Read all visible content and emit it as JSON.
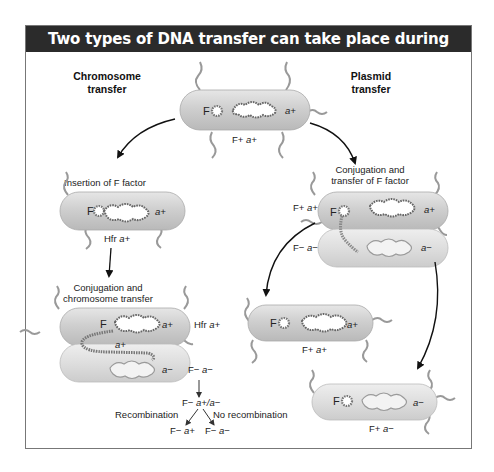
{
  "title": "Two types of DNA transfer can take place during conjugation",
  "columns": {
    "left": {
      "line1": "Chromosome",
      "line2": "transfer"
    },
    "right": {
      "line1": "Plasmid",
      "line2": "transfer"
    }
  },
  "colors": {
    "title_bg": "#2b2b2b",
    "cell_fill": "#d0d0d0",
    "cell_light": "#e4e4e4",
    "dna_dark": "#555555",
    "dna_light": "#ffffff"
  },
  "cells": {
    "top": {
      "f_label": "F",
      "gene_label": "a+",
      "genotype_F": "F+",
      "genotype_a": "a+"
    },
    "hfr": {
      "step": "Insertion of F factor",
      "f_label": "F",
      "gene_label": "a+",
      "genotype_F": "Hfr",
      "genotype_a": "a+"
    },
    "chrom_conj": {
      "step_line1": "Conjugation and",
      "step_line2": "chromosome transfer",
      "donor_f": "F",
      "donor_gene": "a+",
      "donor_genotype_F": "Hfr",
      "donor_genotype_a": "a+",
      "transfer_gene": "a+",
      "recipient_gene": "a−",
      "recipient_genotype_F": "F−",
      "recipient_genotype_a": "a−"
    },
    "recomb": {
      "start_F": "F−",
      "start_a": "a−",
      "merodiploid_F": "F−",
      "merodiploid_a": "a+/a−",
      "recombination": "Recombination",
      "no_recombination": "No recombination",
      "result1_F": "F−",
      "result1_a": "a+",
      "result2_F": "F−",
      "result2_a": "a−"
    },
    "plasmid_conj": {
      "step_line1": "Conjugation and",
      "step_line2": "transfer of F factor",
      "donor_genotype_F": "F+",
      "donor_genotype_a": "a+",
      "donor_f": "F",
      "donor_gene": "a+",
      "recipient_genotype_F": "F−",
      "recipient_genotype_a": "a−",
      "recipient_gene": "a−"
    },
    "result_donor": {
      "f_label": "F",
      "gene_label": "a+",
      "genotype_F": "F+",
      "genotype_a": "a+"
    },
    "result_recipient": {
      "f_label": "F",
      "gene_label": "a−",
      "genotype_F": "F+",
      "genotype_a": "a−"
    }
  }
}
